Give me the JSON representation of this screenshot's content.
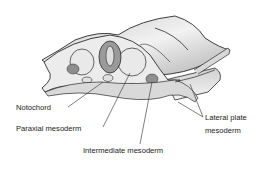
{
  "diagram": {
    "labels": {
      "notochord": "Notochord",
      "paraxial": "Paraxial mesoderm",
      "intermediate": "Intermediate mesoderm",
      "lateral_line1": "Lateral plate",
      "lateral_line2": "mesoderm"
    },
    "colors": {
      "outline": "#2a2a2a",
      "light_fill": "#e6e6e6",
      "mid_fill": "#bdbdbd",
      "dark_fill": "#8e8e8e",
      "text": "#222222"
    }
  }
}
